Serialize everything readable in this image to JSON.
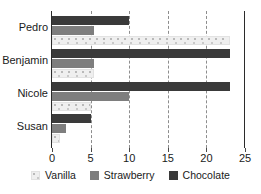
{
  "chart_data": {
    "type": "bar",
    "orientation": "horizontal",
    "title": "",
    "xlabel": "",
    "ylabel": "",
    "categories": [
      "Pedro",
      "Benjamin",
      "Nicole",
      "Susan"
    ],
    "series": [
      {
        "name": "Vanilla",
        "color": "#efefef",
        "values": [
          23,
          5.5,
          5,
          1
        ]
      },
      {
        "name": "Strawberry",
        "color": "#7e7e7e",
        "values": [
          5.5,
          5.5,
          10,
          1.8
        ]
      },
      {
        "name": "Chocolate",
        "color": "#3a3a3a",
        "values": [
          10,
          23,
          23,
          5
        ]
      }
    ],
    "xlim": [
      0,
      25
    ],
    "xticks": [
      0,
      5,
      10,
      15,
      20,
      25
    ],
    "xtick_labels": [
      "0",
      "5",
      "10",
      "15",
      "20",
      "25"
    ],
    "gridlines": [
      5,
      10,
      15,
      20
    ],
    "grid": true,
    "legend_position": "bottom"
  },
  "legend": {
    "items": [
      {
        "label": "Vanilla",
        "swatch": "vanilla-swatch"
      },
      {
        "label": "Strawberry",
        "swatch": "strawberry-swatch"
      },
      {
        "label": "Chocolate",
        "swatch": "chocolate-swatch"
      }
    ]
  },
  "axis": {
    "ticks": [
      {
        "value": 0,
        "label": "0"
      },
      {
        "value": 5,
        "label": "5"
      },
      {
        "value": 10,
        "label": "10"
      },
      {
        "value": 15,
        "label": "15"
      },
      {
        "value": 20,
        "label": "20"
      },
      {
        "value": 25,
        "label": "25"
      }
    ]
  },
  "categories": [
    {
      "label": "Pedro"
    },
    {
      "label": "Benjamin"
    },
    {
      "label": "Nicole"
    },
    {
      "label": "Susan"
    }
  ]
}
